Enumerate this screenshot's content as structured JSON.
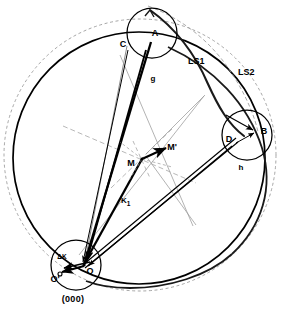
{
  "figure": {
    "type": "geometric-construction-diagram",
    "background_color": "#ffffff",
    "line_color": "#000000",
    "faint_line_color": "#8a8a8a"
  },
  "labels": {
    "point_a": "A",
    "point_b": "B",
    "point_c": "C",
    "point_d": "D",
    "point_m": "M",
    "point_m_prime": "M'",
    "point_o": "O",
    "point_o_prime": "O'",
    "vector_g": "g",
    "vector_h": "h",
    "vector_k1": "K",
    "vector_k1_sub": "1",
    "delta_k": "ΔK",
    "ls1": "LS1",
    "ls2": "LS2",
    "origin_caption": "(000)"
  },
  "geometry": {
    "main_circle": {
      "cx": 139,
      "cy": 158,
      "r": 126,
      "stroke_width": 1.6,
      "style": "solid"
    },
    "outer_dashed_circle": {
      "cx": 140,
      "cy": 155,
      "r": 136,
      "stroke_width": 0.8,
      "style": "dashed"
    },
    "circle_a": {
      "cx": 152,
      "cy": 33,
      "r": 25,
      "stroke_width": 1.2,
      "style": "solid"
    },
    "circle_b": {
      "cx": 247,
      "cy": 135,
      "r": 25,
      "stroke_width": 1.2,
      "style": "solid"
    },
    "circle_o": {
      "cx": 75,
      "cy": 265,
      "r": 25,
      "stroke_width": 1.2,
      "style": "solid"
    },
    "points": {
      "A": {
        "x": 152,
        "y": 41
      },
      "B": {
        "x": 259,
        "y": 131
      },
      "C": {
        "x": 127,
        "y": 45
      },
      "D": {
        "x": 235,
        "y": 139
      },
      "M": {
        "x": 141,
        "y": 159
      },
      "M_prime": {
        "x": 163,
        "y": 151
      },
      "O": {
        "x": 84,
        "y": 265
      },
      "O_prime": {
        "x": 60,
        "y": 275
      }
    },
    "label_positions": {
      "A": {
        "x": 155,
        "y": 36
      },
      "B": {
        "x": 263,
        "y": 133
      },
      "C": {
        "x": 124,
        "y": 45
      },
      "D": {
        "x": 230,
        "y": 141
      },
      "M": {
        "x": 128,
        "y": 165
      },
      "M_prime": {
        "x": 167,
        "y": 152
      },
      "O": {
        "x": 86,
        "y": 273
      },
      "O_prime": {
        "x": 55,
        "y": 281
      },
      "g": {
        "x": 152,
        "y": 80
      },
      "h": {
        "x": 240,
        "y": 168
      },
      "K1": {
        "x": 123,
        "y": 201
      },
      "deltaK": {
        "x": 62,
        "y": 258
      },
      "LS1": {
        "x": 189,
        "y": 62
      },
      "LS2": {
        "x": 240,
        "y": 73
      },
      "origin_caption": {
        "x": 70,
        "y": 300
      }
    }
  }
}
